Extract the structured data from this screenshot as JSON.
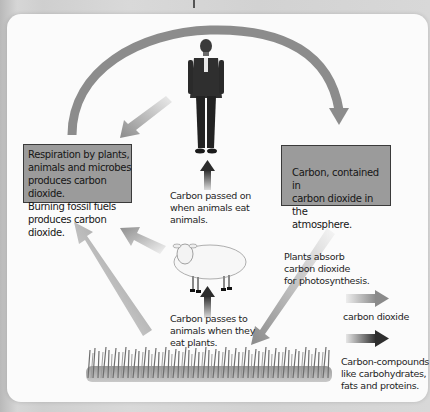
{
  "diagram": {
    "colors": {
      "background": "#d4d4d4",
      "panel": "#fbfbfb",
      "box_fill": "#9b9b9b",
      "box_border": "#3a3a3a",
      "arrow_gray": "#8a8a8a",
      "arrow_dark": "#3c3c3c"
    },
    "boxes": {
      "respiration": {
        "lines": [
          "Respiration by plants,",
          "animals and microbes",
          "produces carbon dioxide.",
          "Burning fossil fuels",
          "produces carbon dioxide."
        ]
      },
      "atmosphere": {
        "lines": [
          "Carbon, contained in",
          "carbon dioxide in the",
          "atmosphere."
        ]
      }
    },
    "labels": {
      "animals_eat_animals": "Carbon passed on\nwhen animals eat\nanimals.",
      "animals_eat_plants": "Carbon passes to\nanimals when they\neat plants.",
      "photosynthesis": "Plants absorb\ncarbon dioxide\nfor photosynthesis."
    },
    "nodes": [
      "human",
      "sheep",
      "grass",
      "respiration-box",
      "atmosphere-box"
    ],
    "legend": [
      {
        "label": "carbon dioxide",
        "arrow_style": "light-gradient"
      },
      {
        "label": "Carbon-compounds\nlike carbohydrates,\nfats and proteins.",
        "arrow_style": "dark-gradient"
      }
    ]
  }
}
